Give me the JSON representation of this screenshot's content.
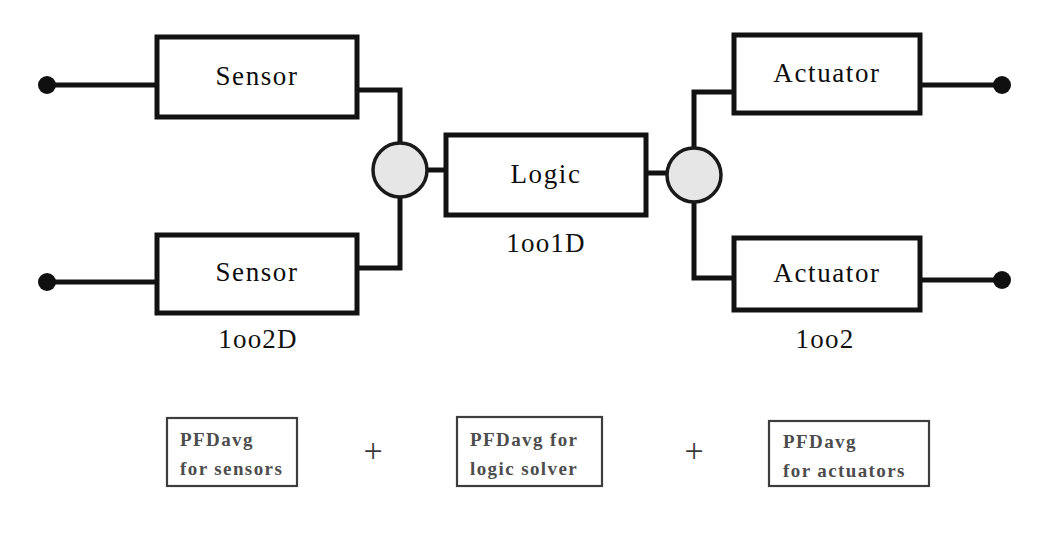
{
  "diagram": {
    "colors": {
      "wire": "#121212",
      "box_stroke": "#121212",
      "vote_fill": "#e6e6e6",
      "vote_stroke": "#1a1a1a",
      "terminal_dot": "#101010",
      "pfd_text": "#4d4d4d",
      "pfd_border": "#3d3d3d",
      "background": "#ffffff"
    },
    "blocks": [
      {
        "id": "sensor-top",
        "label": "Sensor"
      },
      {
        "id": "sensor-bottom",
        "label": "Sensor"
      },
      {
        "id": "logic",
        "label": "Logic"
      },
      {
        "id": "actuator-top",
        "label": "Actuator"
      },
      {
        "id": "actuator-bottom",
        "label": "Actuator"
      }
    ],
    "vote_labels": [
      {
        "id": "sensor-vote",
        "text": "1oo2D"
      },
      {
        "id": "logic-vote",
        "text": "1oo1D"
      },
      {
        "id": "actuator-vote",
        "text": "1oo2"
      }
    ],
    "junctions": [
      {
        "id": "sensor-junction"
      },
      {
        "id": "actuator-junction"
      }
    ],
    "terminals": [
      {
        "id": "input-terminal-top"
      },
      {
        "id": "input-terminal-bottom"
      },
      {
        "id": "output-terminal-top"
      },
      {
        "id": "output-terminal-bottom"
      }
    ]
  },
  "formula": {
    "terms": [
      {
        "id": "pfd-sensors",
        "line1": "PFDavg",
        "line2": "for sensors"
      },
      {
        "id": "pfd-logic",
        "line1": "PFDavg for",
        "line2": "logic solver"
      },
      {
        "id": "pfd-actuators",
        "line1": "PFDavg",
        "line2": "for actuators"
      }
    ],
    "operators": [
      {
        "id": "plus-1",
        "symbol": "+"
      },
      {
        "id": "plus-2",
        "symbol": "+"
      }
    ]
  }
}
